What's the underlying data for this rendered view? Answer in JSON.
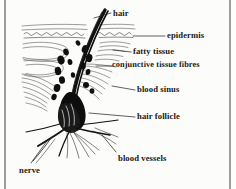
{
  "figure": {
    "kind": "anatomical-diagram",
    "background_color": "#fcfcfb",
    "ink_color": "#161616",
    "border_color": "#7a7a7a"
  },
  "labels": [
    {
      "id": "hair",
      "text": "hair",
      "x": 113,
      "y": 9,
      "leader": true
    },
    {
      "id": "epidermis",
      "text": "epidermis",
      "x": 167,
      "y": 33,
      "leader": true
    },
    {
      "id": "fatty-tissue",
      "text": "fatty tissue",
      "x": 133,
      "y": 49,
      "leader": true
    },
    {
      "id": "conjunctive-tissue-fibres",
      "text": "conjunctive tissue fibres",
      "x": 113,
      "y": 63,
      "leader": true
    },
    {
      "id": "blood-sinus",
      "text": "blood sinus",
      "x": 137,
      "y": 87,
      "leader": true
    },
    {
      "id": "hair-follicle",
      "text": "hair follicle",
      "x": 137,
      "y": 114,
      "leader": true
    },
    {
      "id": "blood-vessels",
      "text": "blood vessels",
      "x": 118,
      "y": 155,
      "leader": true
    },
    {
      "id": "nerve",
      "text": "nerve",
      "x": 19,
      "y": 168,
      "leader": true
    }
  ],
  "leader_lines": [
    {
      "for": "hair",
      "from": [
        111,
        13
      ],
      "to": [
        92,
        19
      ]
    },
    {
      "for": "epidermis",
      "from": [
        165,
        36
      ],
      "to": [
        132,
        36
      ]
    },
    {
      "for": "fatty-tissue",
      "from": [
        131,
        52
      ],
      "to": [
        112,
        50
      ]
    },
    {
      "for": "conjunctive-tissue-fibres",
      "from": [
        112,
        66
      ],
      "to": [
        95,
        66
      ]
    },
    {
      "for": "blood-sinus",
      "from": [
        135,
        90
      ],
      "to": [
        112,
        86
      ]
    },
    {
      "for": "hair-follicle",
      "from": [
        135,
        117
      ],
      "to": [
        88,
        113
      ]
    },
    {
      "for": "blood-vessels",
      "from": [
        116,
        152
      ],
      "to": [
        101,
        134
      ]
    },
    {
      "for": "nerve",
      "from": [
        30,
        164
      ],
      "to": [
        48,
        140
      ]
    }
  ],
  "anatomy_parts": [
    "hair shaft",
    "epidermis (wavy surface line)",
    "fatty tissue layer",
    "conjunctive tissue fibres",
    "blood sinus (dark blobs)",
    "hair follicle (dark central bulb)",
    "blood vessels (fanning strokes)",
    "nerve (lower left stroke)"
  ]
}
